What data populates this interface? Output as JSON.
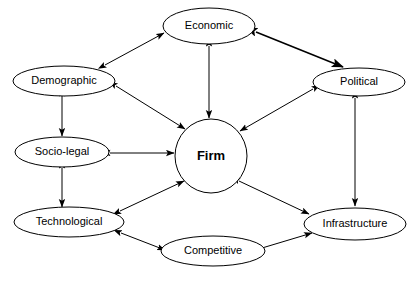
{
  "diagram": {
    "background_color": "#ffffff",
    "stroke_color": "#000000",
    "nodes": [
      {
        "id": "economic",
        "label": "Economic",
        "shape": "ellipse",
        "cx": 209,
        "cy": 26,
        "rx": 46,
        "ry": 18,
        "emphasis": "normal"
      },
      {
        "id": "demographic",
        "label": "Demographic",
        "shape": "ellipse",
        "cx": 64,
        "cy": 81,
        "rx": 51,
        "ry": 15,
        "emphasis": "normal"
      },
      {
        "id": "political",
        "label": "Political",
        "shape": "ellipse",
        "cx": 359,
        "cy": 82,
        "rx": 46,
        "ry": 14,
        "emphasis": "normal"
      },
      {
        "id": "socio-legal",
        "label": "Socio-legal",
        "shape": "ellipse",
        "cx": 62,
        "cy": 152,
        "rx": 47,
        "ry": 15,
        "emphasis": "normal"
      },
      {
        "id": "firm",
        "label": "Firm",
        "shape": "circle",
        "cx": 211,
        "cy": 156,
        "rx": 36,
        "ry": 37,
        "emphasis": "bold"
      },
      {
        "id": "technological",
        "label": "Technological",
        "shape": "ellipse",
        "cx": 69,
        "cy": 222,
        "rx": 55,
        "ry": 15,
        "emphasis": "normal"
      },
      {
        "id": "competitive",
        "label": "Competitive",
        "shape": "ellipse",
        "cx": 213,
        "cy": 251,
        "rx": 52,
        "ry": 15,
        "emphasis": "normal"
      },
      {
        "id": "infrastructure",
        "label": "Infrastructure",
        "shape": "ellipse",
        "cx": 355,
        "cy": 224,
        "rx": 51,
        "ry": 16,
        "emphasis": "normal"
      }
    ],
    "edges": [
      {
        "id": "demographic-economic",
        "from": "demographic",
        "to": "economic",
        "x1": 105,
        "y1": 65,
        "x2": 164,
        "y2": 33,
        "arrows": "both",
        "weight": "normal"
      },
      {
        "id": "economic-political",
        "from": "economic",
        "to": "political",
        "x1": 256,
        "y1": 32,
        "x2": 343,
        "y2": 67,
        "arrows": "both",
        "weight": "thick"
      },
      {
        "id": "economic-firm",
        "from": "economic",
        "to": "firm",
        "x1": 209,
        "y1": 46,
        "x2": 209,
        "y2": 118,
        "arrows": "both",
        "weight": "normal"
      },
      {
        "id": "demographic-firm",
        "from": "demographic",
        "to": "firm",
        "x1": 116,
        "y1": 86,
        "x2": 185,
        "y2": 129,
        "arrows": "both",
        "weight": "normal"
      },
      {
        "id": "political-firm",
        "from": "political",
        "to": "firm",
        "x1": 313,
        "y1": 89,
        "x2": 240,
        "y2": 131,
        "arrows": "both",
        "weight": "normal"
      },
      {
        "id": "demographic-sociolegal",
        "from": "demographic",
        "to": "socio-legal",
        "x1": 62,
        "y1": 96,
        "x2": 62,
        "y2": 136,
        "arrows": "both",
        "weight": "normal"
      },
      {
        "id": "sociolegal-technological",
        "from": "socio-legal",
        "to": "technological",
        "x1": 62,
        "y1": 168,
        "x2": 62,
        "y2": 207,
        "arrows": "both",
        "weight": "normal"
      },
      {
        "id": "sociolegal-firm",
        "from": "socio-legal",
        "to": "firm",
        "x1": 110,
        "y1": 153,
        "x2": 174,
        "y2": 153,
        "arrows": "both",
        "weight": "normal"
      },
      {
        "id": "technological-firm",
        "from": "technological",
        "to": "firm",
        "x1": 120,
        "y1": 211,
        "x2": 184,
        "y2": 181,
        "arrows": "both",
        "weight": "normal"
      },
      {
        "id": "firm-infrastructure",
        "from": "firm",
        "to": "infrastructure",
        "x1": 239,
        "y1": 181,
        "x2": 309,
        "y2": 214,
        "arrows": "both",
        "weight": "normal"
      },
      {
        "id": "political-infrastructure",
        "from": "political",
        "to": "infrastructure",
        "x1": 355,
        "y1": 98,
        "x2": 355,
        "y2": 206,
        "arrows": "both",
        "weight": "normal"
      },
      {
        "id": "technological-competitive",
        "from": "technological",
        "to": "competitive",
        "x1": 121,
        "y1": 233,
        "x2": 165,
        "y2": 250,
        "arrows": "both",
        "weight": "normal"
      },
      {
        "id": "competitive-infrastructure",
        "from": "competitive",
        "to": "infrastructure",
        "x1": 262,
        "y1": 248,
        "x2": 312,
        "y2": 233,
        "arrows": "both",
        "weight": "normal"
      }
    ]
  }
}
